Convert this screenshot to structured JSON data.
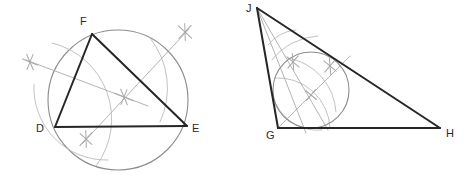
{
  "figure": {
    "background_color": "#ffffff",
    "width": 470,
    "height": 188,
    "colors": {
      "triangle_stroke": "#262626",
      "circle_stroke": "#8d8d8d",
      "construction_stroke": "#b4b4b4",
      "label_color": "#2b2b2b"
    }
  },
  "left_figure": {
    "name": "circumscribed-circle-construction",
    "description": "Triangle DEF inscribed in a circle with perpendicular bisector construction marks",
    "triangle": {
      "vertices": [
        {
          "id": "D",
          "label": "D",
          "x": 55,
          "y": 127,
          "label_x": 36,
          "label_y": 132
        },
        {
          "id": "E",
          "label": "E",
          "x": 187,
          "y": 126,
          "label_x": 192,
          "label_y": 132
        },
        {
          "id": "F",
          "label": "F",
          "x": 92,
          "y": 34,
          "label_x": 80,
          "label_y": 25
        }
      ]
    },
    "circle": {
      "cx": 118,
      "cy": 100,
      "r": 70
    },
    "construction_lines": [
      {
        "id": "perp-bisector-DF",
        "x1": 26,
        "y1": 60,
        "x2": 148,
        "y2": 106
      },
      {
        "id": "perp-bisector-DE",
        "x1": 189,
        "y1": 29,
        "x2": 82,
        "y2": 144
      }
    ],
    "construction_arcs": [
      {
        "id": "arc-from-D-upper",
        "d": "M 52 43 A 78 78 0 0 1 96 166"
      },
      {
        "id": "arc-from-F-lower",
        "d": "M 34 84 A 72 72 0 0 0 108 160"
      },
      {
        "id": "arc-from-D-right",
        "d": "M 150 38 A 80 80 0 0 1 160 122"
      }
    ],
    "cross_marks": [
      {
        "id": "cross-DF-outer",
        "x": 30,
        "y": 62,
        "angle": 22
      },
      {
        "id": "cross-DF-inner",
        "x": 124,
        "y": 97,
        "angle": 22
      },
      {
        "id": "cross-DE-upper",
        "x": 185,
        "y": 32,
        "angle": -47
      },
      {
        "id": "cross-DE-lower",
        "x": 86,
        "y": 139,
        "angle": -47
      }
    ]
  },
  "right_figure": {
    "name": "inscribed-circle-construction",
    "description": "Triangle GHJ with an inscribed circle and angle bisector construction marks",
    "triangle": {
      "vertices": [
        {
          "id": "J",
          "label": "J",
          "x": 257,
          "y": 8,
          "label_x": 246,
          "label_y": 12
        },
        {
          "id": "G",
          "label": "G",
          "x": 278,
          "y": 128,
          "label_x": 266,
          "label_y": 139
        },
        {
          "id": "H",
          "label": "H",
          "x": 440,
          "y": 128,
          "label_x": 446,
          "label_y": 137
        }
      ]
    },
    "circle": {
      "cx": 311,
      "cy": 90,
      "r": 38
    },
    "construction_lines": [
      {
        "id": "bisector-from-J",
        "x1": 257,
        "y1": 8,
        "x2": 328,
        "y2": 130
      },
      {
        "id": "bisector-from-G",
        "x1": 278,
        "y1": 128,
        "x2": 350,
        "y2": 56
      },
      {
        "id": "bisector-from-J-second",
        "x1": 257,
        "y1": 8,
        "x2": 306,
        "y2": 133
      }
    ],
    "construction_arcs": [
      {
        "id": "arc-J-span",
        "d": "M 268 45 A 40 40 0 0 1 296 30"
      },
      {
        "id": "arc-J-wide",
        "d": "M 272 60 A 62 62 0 0 1 318 36"
      },
      {
        "id": "arc-G-upper",
        "d": "M 274 78 A 52 52 0 0 1 330 128"
      },
      {
        "id": "arc-G-cross",
        "d": "M 288 58 A 58 58 0 0 1 336 112"
      },
      {
        "id": "arc-incircle-touch",
        "d": "M 276 104 A 46 46 0 0 0 322 130"
      }
    ],
    "cross_marks": [
      {
        "id": "cross-J-bisector-left",
        "x": 293,
        "y": 62,
        "angle": 40
      },
      {
        "id": "cross-J-bisector-right",
        "x": 330,
        "y": 66,
        "angle": 40
      },
      {
        "id": "cross-incenter",
        "x": 311,
        "y": 95,
        "angle": 40
      }
    ]
  }
}
